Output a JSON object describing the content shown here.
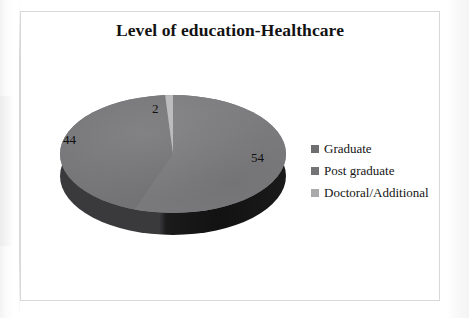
{
  "chart_data": {
    "type": "pie",
    "title": "Level of education-Healthcare",
    "categories": [
      "Graduate",
      "Post graduate",
      "Doctoral/Additional"
    ],
    "values": [
      54,
      44,
      2
    ],
    "labels": [
      "54",
      "44",
      "2"
    ],
    "xlabel": "",
    "ylabel": "",
    "legend_position": "right",
    "grid": false,
    "three_d": true,
    "colors": [
      "#7c7c7f",
      "#757578",
      "#b9b9bb"
    ],
    "depth_colors": [
      "#141415",
      "#3a3a3c"
    ],
    "slices": [
      {
        "name": "Graduate",
        "value": 54,
        "label": "54",
        "color": "#7c7c7f"
      },
      {
        "name": "Post graduate",
        "value": 44,
        "label": "44",
        "color": "#757578"
      },
      {
        "name": "Doctoral/Additional",
        "value": 2,
        "label": "2",
        "color": "#b9b9bb"
      }
    ]
  },
  "chart": {
    "title": "Level of education-Healthcare",
    "data_labels": {
      "doctoral": "2",
      "post_graduate": "44",
      "graduate": "54"
    },
    "legend": {
      "items": [
        {
          "label": "Graduate",
          "color": "#6f6f72"
        },
        {
          "label": "Post graduate",
          "color": "#747477"
        },
        {
          "label": "Doctoral/Additional",
          "color": "#a9a9ac"
        }
      ]
    }
  }
}
